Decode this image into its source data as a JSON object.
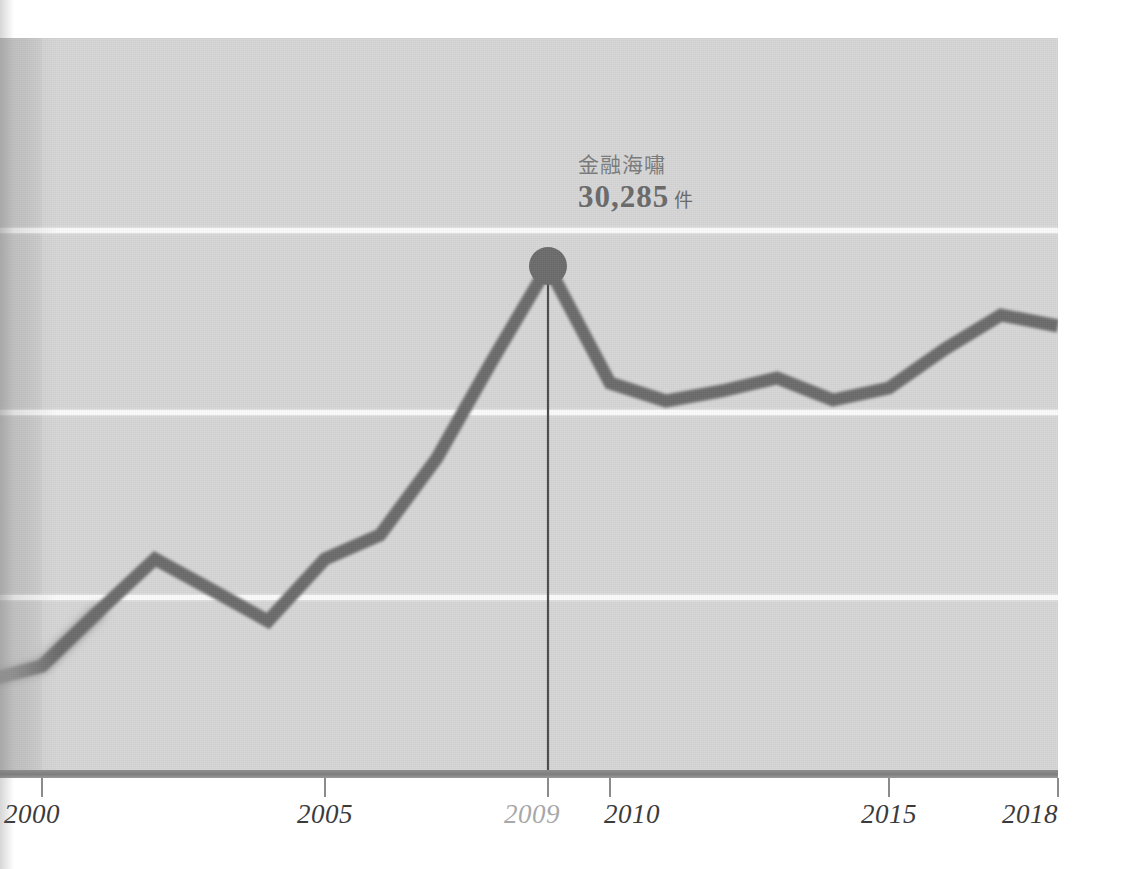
{
  "annotation": {
    "label": "金融海嘯",
    "value": "30,285",
    "unit": "件"
  },
  "axis": {
    "ticks": [
      {
        "label": "2000",
        "year": 2000,
        "muted": false
      },
      {
        "label": "2005",
        "year": 2005,
        "muted": false
      },
      {
        "label": "2009",
        "year": 2009,
        "muted": true
      },
      {
        "label": "2010",
        "year": 2010,
        "muted": false
      },
      {
        "label": "2015",
        "year": 2015,
        "muted": false
      },
      {
        "label": "2018",
        "year": 2018,
        "muted": false
      }
    ]
  },
  "colors": {
    "line": "#6b6b6b",
    "panel": "#d6d6d6",
    "panel_band": "#c2c2c2",
    "gridline": "#fbfbfb",
    "axis": "#838383",
    "label": "#3b3b3b",
    "label_muted": "#a8a8a8",
    "annotation_text": "#7b7b7b",
    "marker": "#6b6b6b"
  },
  "chart_data": {
    "type": "line",
    "title": "",
    "subtitle": "",
    "xlabel": "",
    "ylabel": "",
    "grid": "horizontal",
    "legend": "none",
    "xlim": [
      1999,
      2018
    ],
    "ylim": [
      0,
      34000
    ],
    "x_tick_labels": [
      "2000",
      "2005",
      "2009",
      "2010",
      "2015",
      "2018"
    ],
    "y_gridline_values": [
      30285,
      22500,
      14500
    ],
    "x": [
      1999,
      2000,
      2001,
      2002,
      2003,
      2004,
      2005,
      2006,
      2007,
      2008,
      2009,
      2010,
      2011,
      2012,
      2013,
      2014,
      2015,
      2016,
      2017,
      2018
    ],
    "values": [
      13000,
      13700,
      16200,
      18800,
      17200,
      15900,
      18800,
      19900,
      23400,
      26900,
      30285,
      25300,
      24400,
      24900,
      25400,
      24400,
      25100,
      26800,
      28100,
      27600
    ],
    "series": [
      {
        "name": "案件數",
        "values": [
          13000,
          13700,
          16200,
          18800,
          17200,
          15900,
          18800,
          19900,
          23400,
          26900,
          30285,
          25300,
          24400,
          24900,
          25400,
          24400,
          25100,
          26800,
          28100,
          27600
        ]
      }
    ],
    "annotations": [
      {
        "x": 2009,
        "y": 30285,
        "text": "金融海嘯",
        "value_text": "30,285 件",
        "marker": "circle",
        "dropline": true
      }
    ]
  },
  "geometry": {
    "points": [
      {
        "x": -22,
        "y": 645
      },
      {
        "x": 42,
        "y": 628
      },
      {
        "x": 98,
        "y": 574
      },
      {
        "x": 155,
        "y": 521
      },
      {
        "x": 212,
        "y": 552
      },
      {
        "x": 268,
        "y": 583
      },
      {
        "x": 325,
        "y": 521
      },
      {
        "x": 380,
        "y": 497
      },
      {
        "x": 437,
        "y": 420
      },
      {
        "x": 492,
        "y": 323
      },
      {
        "x": 548,
        "y": 228
      },
      {
        "x": 610,
        "y": 345
      },
      {
        "x": 666,
        "y": 363
      },
      {
        "x": 722,
        "y": 353
      },
      {
        "x": 777,
        "y": 340
      },
      {
        "x": 833,
        "y": 362
      },
      {
        "x": 889,
        "y": 350
      },
      {
        "x": 945,
        "y": 311
      },
      {
        "x": 1001,
        "y": 277
      },
      {
        "x": 1058,
        "y": 288
      }
    ],
    "gridlines_y": [
      230,
      412,
      597
    ],
    "tick_x": [
      42,
      325,
      548,
      610,
      889,
      1058
    ],
    "marker": {
      "x": 548,
      "y": 228,
      "r": 19
    },
    "dropline": {
      "x": 548,
      "y0": 228,
      "y1": 734
    }
  }
}
